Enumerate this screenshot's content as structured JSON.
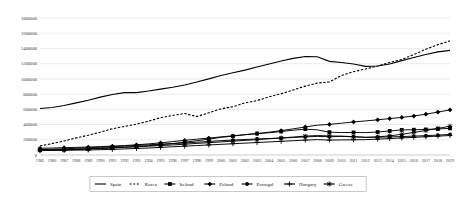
{
  "chart_data": {
    "type": "line",
    "title": "",
    "xlabel": "",
    "ylabel": "",
    "ylim": [
      0,
      1800000
    ],
    "ytick_step": 200000,
    "grid": true,
    "legend_position": "bottom",
    "yticks": [
      "0",
      "200000",
      "400000",
      "600000",
      "800000",
      "1000000",
      "1200000",
      "1400000",
      "1600000",
      "1800000"
    ],
    "categories": [
      "1985",
      "1986",
      "1987",
      "1988",
      "1989",
      "1990",
      "1991",
      "1992",
      "1993",
      "1994",
      "1995",
      "1996",
      "1997",
      "1998",
      "1999",
      "2000",
      "2001",
      "2002",
      "2003",
      "2004",
      "2005",
      "2006",
      "2007",
      "2008",
      "2009",
      "2010",
      "2011",
      "2012",
      "2013",
      "2014",
      "2015",
      "2016",
      "2017",
      "2018",
      "2019"
    ],
    "series": [
      {
        "name": "Spain",
        "style": "solid",
        "marker": "none",
        "color": "#000000",
        "values": [
          610000,
          625000,
          650000,
          685000,
          720000,
          760000,
          795000,
          820000,
          820000,
          840000,
          865000,
          890000,
          920000,
          960000,
          1000000,
          1045000,
          1080000,
          1115000,
          1155000,
          1195000,
          1235000,
          1270000,
          1295000,
          1290000,
          1230000,
          1215000,
          1195000,
          1165000,
          1170000,
          1195000,
          1240000,
          1280000,
          1320000,
          1355000,
          1375000
        ]
      },
      {
        "name": "Korea",
        "style": "dashed",
        "marker": "none",
        "color": "#000000",
        "values": [
          120000,
          150000,
          185000,
          225000,
          260000,
          300000,
          345000,
          375000,
          405000,
          445000,
          490000,
          520000,
          545000,
          505000,
          555000,
          605000,
          635000,
          685000,
          715000,
          765000,
          805000,
          855000,
          905000,
          945000,
          960000,
          1045000,
          1095000,
          1130000,
          1170000,
          1215000,
          1255000,
          1320000,
          1390000,
          1450000,
          1500000
        ]
      },
      {
        "name": "Ireland",
        "style": "solid",
        "marker": "square",
        "color": "#000000",
        "values": [
          65000,
          68000,
          72000,
          76000,
          82000,
          90000,
          96000,
          104000,
          112000,
          122000,
          136000,
          150000,
          168000,
          188000,
          208000,
          232000,
          248000,
          268000,
          282000,
          292000,
          308000,
          326000,
          340000,
          330000,
          300000,
          295000,
          296000,
          294000,
          302000,
          316000,
          330000,
          332000,
          336000,
          342000,
          350000
        ]
      },
      {
        "name": "Poland",
        "style": "solid",
        "marker": "diamond",
        "color": "#000000",
        "values": [
          88000,
          92000,
          96000,
          100000,
          104000,
          110000,
          116000,
          124000,
          134000,
          146000,
          160000,
          176000,
          192000,
          208000,
          222000,
          238000,
          252000,
          266000,
          280000,
          300000,
          320000,
          344000,
          368000,
          392000,
          402000,
          418000,
          434000,
          448000,
          462000,
          478000,
          494000,
          512000,
          536000,
          564000,
          592000
        ]
      },
      {
        "name": "Portugal",
        "style": "solid",
        "marker": "circle",
        "color": "#000000",
        "values": [
          72000,
          76000,
          82000,
          88000,
          94000,
          102000,
          110000,
          118000,
          126000,
          134000,
          142000,
          150000,
          158000,
          168000,
          178000,
          188000,
          196000,
          204000,
          210000,
          216000,
          222000,
          230000,
          238000,
          244000,
          240000,
          244000,
          240000,
          232000,
          234000,
          238000,
          242000,
          248000,
          254000,
          262000,
          270000
        ]
      },
      {
        "name": "Hungary",
        "style": "solid",
        "marker": "cross",
        "color": "#000000",
        "values": [
          58000,
          60000,
          62000,
          64000,
          66000,
          70000,
          74000,
          80000,
          86000,
          92000,
          100000,
          108000,
          116000,
          124000,
          132000,
          140000,
          148000,
          156000,
          164000,
          172000,
          180000,
          188000,
          196000,
          202000,
          196000,
          198000,
          200000,
          202000,
          208000,
          216000,
          224000,
          232000,
          240000,
          248000,
          256000
        ]
      },
      {
        "name": "Greece",
        "style": "solid",
        "marker": "star",
        "color": "#000000",
        "values": [
          62000,
          64000,
          68000,
          72000,
          78000,
          84000,
          92000,
          100000,
          108000,
          116000,
          124000,
          132000,
          142000,
          152000,
          162000,
          172000,
          182000,
          192000,
          202000,
          214000,
          224000,
          236000,
          248000,
          256000,
          250000,
          248000,
          240000,
          232000,
          238000,
          252000,
          272000,
          296000,
          322000,
          350000,
          378000
        ]
      }
    ]
  },
  "legend": {
    "items": [
      {
        "label": "Spain"
      },
      {
        "label": "Korea"
      },
      {
        "label": "Ireland"
      },
      {
        "label": "Poland"
      },
      {
        "label": "Portugal"
      },
      {
        "label": "Hungary"
      },
      {
        "label": "Greece"
      }
    ]
  }
}
